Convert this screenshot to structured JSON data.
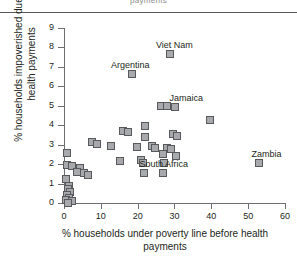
{
  "header": {
    "clipped_text": "payments"
  },
  "chart_data": {
    "type": "scatter",
    "title": "",
    "xlabel": "% households under poverty line before health payments",
    "ylabel": "% households impoverished due to health payments",
    "xlim": [
      0,
      62
    ],
    "ylim": [
      0,
      9.3
    ],
    "xticks": [
      0,
      10,
      20,
      30,
      40,
      50,
      60
    ],
    "yticks": [
      0,
      1,
      2,
      3,
      4,
      5,
      6,
      7,
      8,
      9
    ],
    "grid": false,
    "legend": "none",
    "marker": "square",
    "marker_fill": "#a7a9ac",
    "marker_edge": "#58595b",
    "axis_color": "#6d6e71",
    "points": [
      {
        "x": 28.5,
        "y": 7.7,
        "label": "Viet Nam",
        "label_dx": -13,
        "label_dy": -13
      },
      {
        "x": 18.2,
        "y": 6.7,
        "label": "Argentina",
        "label_dx": -20,
        "label_dy": -13
      },
      {
        "x": 26.0,
        "y": 5.05,
        "label": "",
        "label_dx": 0,
        "label_dy": 0
      },
      {
        "x": 27.6,
        "y": 5.05,
        "label": "",
        "label_dx": 0,
        "label_dy": 0
      },
      {
        "x": 30.0,
        "y": 5.0,
        "label": "Jamaica",
        "label_dx": -5,
        "label_dy": -13
      },
      {
        "x": 39.3,
        "y": 4.3,
        "label": "",
        "label_dx": 0,
        "label_dy": 0
      },
      {
        "x": 21.8,
        "y": 4.0,
        "label": "",
        "label_dx": 0,
        "label_dy": 0
      },
      {
        "x": 15.8,
        "y": 3.75,
        "label": "",
        "label_dx": 0,
        "label_dy": 0
      },
      {
        "x": 17.0,
        "y": 3.7,
        "label": "",
        "label_dx": 0,
        "label_dy": 0
      },
      {
        "x": 21.8,
        "y": 3.45,
        "label": "",
        "label_dx": 0,
        "label_dy": 0
      },
      {
        "x": 29.3,
        "y": 3.6,
        "label": "",
        "label_dx": 0,
        "label_dy": 0
      },
      {
        "x": 30.4,
        "y": 3.5,
        "label": "",
        "label_dx": 0,
        "label_dy": 0
      },
      {
        "x": 7.2,
        "y": 3.2,
        "label": "",
        "label_dx": 0,
        "label_dy": 0
      },
      {
        "x": 8.6,
        "y": 3.1,
        "label": "",
        "label_dx": 0,
        "label_dy": 0
      },
      {
        "x": 12.6,
        "y": 3.0,
        "label": "",
        "label_dx": 0,
        "label_dy": 0
      },
      {
        "x": 19.5,
        "y": 2.95,
        "label": "",
        "label_dx": 0,
        "label_dy": 0
      },
      {
        "x": 23.5,
        "y": 3.0,
        "label": "",
        "label_dx": 0,
        "label_dy": 0
      },
      {
        "x": 24.5,
        "y": 2.9,
        "label": "",
        "label_dx": 0,
        "label_dy": 0
      },
      {
        "x": 27.8,
        "y": 2.9,
        "label": "",
        "label_dx": 0,
        "label_dy": 0
      },
      {
        "x": 28.8,
        "y": 2.85,
        "label": "",
        "label_dx": 0,
        "label_dy": 0
      },
      {
        "x": 0.6,
        "y": 2.6,
        "label": "",
        "label_dx": 0,
        "label_dy": 0
      },
      {
        "x": 26.5,
        "y": 2.55,
        "label": "",
        "label_dx": 0,
        "label_dy": 0
      },
      {
        "x": 30.2,
        "y": 2.45,
        "label": "",
        "label_dx": 0,
        "label_dy": 0
      },
      {
        "x": 14.8,
        "y": 2.2,
        "label": "",
        "label_dx": 0,
        "label_dy": 0
      },
      {
        "x": 20.5,
        "y": 2.25,
        "label": "",
        "label_dx": 0,
        "label_dy": 0
      },
      {
        "x": 21.3,
        "y": 2.1,
        "label": "",
        "label_dx": 0,
        "label_dy": 0
      },
      {
        "x": 27.0,
        "y": 2.1,
        "label": "",
        "label_dx": 0,
        "label_dy": 0
      },
      {
        "x": 52.8,
        "y": 2.1,
        "label": "Zambia",
        "label_dx": -7,
        "label_dy": -13
      },
      {
        "x": 0.5,
        "y": 2.0,
        "label": "",
        "label_dx": 0,
        "label_dy": 0
      },
      {
        "x": 2.0,
        "y": 1.95,
        "label": "",
        "label_dx": 0,
        "label_dy": 0
      },
      {
        "x": 4.0,
        "y": 1.85,
        "label": "",
        "label_dx": 0,
        "label_dy": 0
      },
      {
        "x": 3.2,
        "y": 1.65,
        "label": "",
        "label_dx": 0,
        "label_dy": 0
      },
      {
        "x": 5.2,
        "y": 1.6,
        "label": "",
        "label_dx": 0,
        "label_dy": 0
      },
      {
        "x": 6.3,
        "y": 1.5,
        "label": "",
        "label_dx": 0,
        "label_dy": 0
      },
      {
        "x": 21.5,
        "y": 1.6,
        "label": "",
        "label_dx": 0,
        "label_dy": 0
      },
      {
        "x": 26.5,
        "y": 1.6,
        "label": "South Africa",
        "label_dx": -22,
        "label_dy": -13
      },
      {
        "x": 0.4,
        "y": 1.3,
        "label": "",
        "label_dx": 0,
        "label_dy": 0
      },
      {
        "x": 1.0,
        "y": 0.9,
        "label": "",
        "label_dx": 0,
        "label_dy": 0
      },
      {
        "x": 0.8,
        "y": 0.75,
        "label": "",
        "label_dx": 0,
        "label_dy": 0
      },
      {
        "x": 1.4,
        "y": 0.6,
        "label": "",
        "label_dx": 0,
        "label_dy": 0
      },
      {
        "x": 0.5,
        "y": 0.45,
        "label": "",
        "label_dx": 0,
        "label_dy": 0
      },
      {
        "x": 1.2,
        "y": 0.3,
        "label": "",
        "label_dx": 0,
        "label_dy": 0
      },
      {
        "x": 0.3,
        "y": 0.2,
        "label": "",
        "label_dx": 0,
        "label_dy": 0
      },
      {
        "x": 2.0,
        "y": 0.15,
        "label": "",
        "label_dx": 0,
        "label_dy": 0
      },
      {
        "x": 0.9,
        "y": 0.05,
        "label": "",
        "label_dx": 0,
        "label_dy": 0
      }
    ]
  }
}
